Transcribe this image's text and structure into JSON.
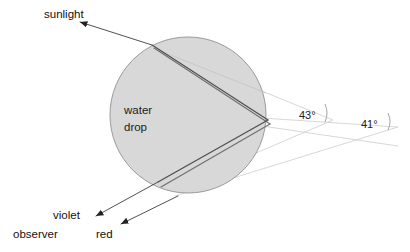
{
  "diagram": {
    "colors": {
      "drop_fill": "#d8d8d8",
      "drop_stroke": "#9a9a9a",
      "ray_dark": "#3d3d3d",
      "ray_mid": "#6e6e6e",
      "wedge_line": "#d2d2d2",
      "text": "#111111"
    },
    "labels": {
      "sunlight": "sunlight",
      "water_drop_line1": "water",
      "water_drop_line2": "drop",
      "violet": "violet",
      "red": "red",
      "observer": "observer",
      "angle_outer": "43°",
      "angle_inner": "41°"
    },
    "geometry": {
      "drop": {
        "cx": 188,
        "cy": 115,
        "r": 78
      },
      "entry_point": {
        "x": 152,
        "y": 45
      },
      "reflection_point": {
        "x": 268,
        "y": 122
      },
      "exit_point": {
        "x": 160,
        "y": 185
      },
      "sunlight_arrow_tip": {
        "x": 74,
        "y": 20
      },
      "violet_arrow_tip": {
        "x": 90,
        "y": 218
      },
      "red_arrow_tip": {
        "x": 117,
        "y": 225
      },
      "wedge_vertex_outer": {
        "x": 333,
        "y": 120
      },
      "wedge_vertex_inner": {
        "x": 398,
        "y": 127
      }
    }
  }
}
